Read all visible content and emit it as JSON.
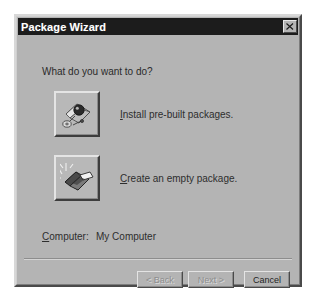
{
  "window": {
    "title": "Package Wizard",
    "close_icon": "close-icon",
    "close_label": "Close"
  },
  "main": {
    "question": "What do you want to do?",
    "options": [
      {
        "icon": "prebuilt-packages-icon",
        "accel": "I",
        "label_rest": "nstall pre-built packages."
      },
      {
        "icon": "empty-package-icon",
        "accel": "C",
        "label_rest": "reate an empty package."
      }
    ],
    "computer": {
      "accel": "C",
      "label_rest": "omputer:",
      "value": "My Computer"
    }
  },
  "footer": {
    "back_label": "< Back",
    "next_label": "Next >",
    "cancel_label": "Cancel"
  },
  "colors": {
    "dialog_face": "#b4b4b4",
    "titlebar": "#1c1c1c",
    "title_text": "#ffffff",
    "body_text": "#2e2e2e",
    "disabled_text": "#8e8e8e"
  }
}
